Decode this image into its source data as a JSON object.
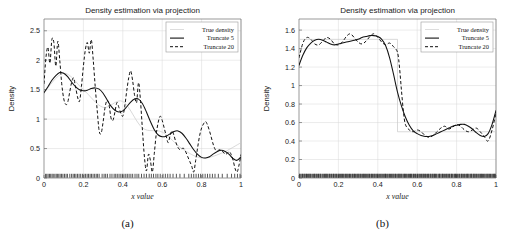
{
  "figure": {
    "panels": [
      {
        "caption": "(a)",
        "title": "Density estimation via projection",
        "xlabel": "x value",
        "ylabel": "Density"
      },
      {
        "caption": "(b)",
        "title": "Density estimation via projection",
        "xlabel": "x value",
        "ylabel": "Density"
      }
    ]
  },
  "legend": {
    "items": [
      {
        "label": "True density",
        "style": "true"
      },
      {
        "label": "Truncate 5",
        "style": "solid"
      },
      {
        "label": "Truncate 20",
        "style": "dashed"
      }
    ]
  },
  "chart_data": [
    {
      "type": "line",
      "title": "Density estimation via projection",
      "xlabel": "x value",
      "ylabel": "Density",
      "caption": "(a)",
      "xlim": [
        0,
        1
      ],
      "ylim": [
        0,
        2.7
      ],
      "xticks": [
        0,
        0.2,
        0.4,
        0.6,
        0.8,
        1
      ],
      "xticklabels": [
        "0",
        "0.2",
        "0.4",
        "0.6",
        "0.8",
        "1"
      ],
      "yticks": [
        0,
        0.5,
        1,
        1.5,
        2,
        2.5
      ],
      "yticklabels": [
        "0",
        "0.5",
        "1",
        "1.5",
        "2",
        "2.5"
      ],
      "grid": true,
      "legend_position": "upper-right",
      "series": [
        {
          "name": "True density",
          "style": "true",
          "x": [
            0,
            0.1,
            0.2,
            0.3,
            0.4,
            0.5,
            0.6,
            0.7,
            0.8,
            0.9,
            1
          ],
          "y": [
            1.45,
            1.78,
            1.5,
            1.2,
            1.3,
            0.85,
            0.78,
            0.5,
            0.34,
            0.42,
            0.6
          ]
        },
        {
          "name": "Truncate 5",
          "style": "solid",
          "x": [
            0.0,
            0.02,
            0.04,
            0.06,
            0.08,
            0.1,
            0.12,
            0.14,
            0.16,
            0.18,
            0.2,
            0.22,
            0.24,
            0.26,
            0.28,
            0.3,
            0.32,
            0.34,
            0.36,
            0.38,
            0.4,
            0.42,
            0.44,
            0.46,
            0.48,
            0.5,
            0.52,
            0.54,
            0.56,
            0.58,
            0.6,
            0.62,
            0.64,
            0.66,
            0.68,
            0.7,
            0.72,
            0.74,
            0.76,
            0.78,
            0.8,
            0.82,
            0.84,
            0.86,
            0.88,
            0.9,
            0.92,
            0.94,
            0.96,
            0.98,
            1.0
          ],
          "y": [
            1.45,
            1.55,
            1.66,
            1.74,
            1.79,
            1.78,
            1.72,
            1.63,
            1.55,
            1.5,
            1.48,
            1.49,
            1.52,
            1.53,
            1.51,
            1.44,
            1.33,
            1.22,
            1.15,
            1.12,
            1.14,
            1.21,
            1.29,
            1.34,
            1.34,
            1.26,
            1.12,
            0.96,
            0.82,
            0.73,
            0.7,
            0.71,
            0.75,
            0.79,
            0.8,
            0.76,
            0.68,
            0.58,
            0.48,
            0.4,
            0.35,
            0.34,
            0.36,
            0.41,
            0.45,
            0.47,
            0.45,
            0.4,
            0.33,
            0.3,
            0.36
          ]
        },
        {
          "name": "Truncate 20",
          "style": "dashed",
          "x": [
            0.0,
            0.01,
            0.02,
            0.03,
            0.04,
            0.05,
            0.06,
            0.07,
            0.08,
            0.09,
            0.1,
            0.11,
            0.12,
            0.13,
            0.14,
            0.15,
            0.16,
            0.17,
            0.18,
            0.19,
            0.2,
            0.21,
            0.22,
            0.23,
            0.24,
            0.25,
            0.26,
            0.27,
            0.28,
            0.29,
            0.3,
            0.31,
            0.32,
            0.33,
            0.34,
            0.35,
            0.36,
            0.37,
            0.38,
            0.39,
            0.4,
            0.41,
            0.42,
            0.43,
            0.44,
            0.45,
            0.46,
            0.47,
            0.48,
            0.49,
            0.5,
            0.51,
            0.52,
            0.53,
            0.54,
            0.55,
            0.56,
            0.57,
            0.58,
            0.59,
            0.6,
            0.61,
            0.62,
            0.63,
            0.64,
            0.65,
            0.66,
            0.67,
            0.68,
            0.69,
            0.7,
            0.71,
            0.72,
            0.73,
            0.74,
            0.75,
            0.76,
            0.77,
            0.78,
            0.79,
            0.8,
            0.81,
            0.82,
            0.83,
            0.84,
            0.85,
            0.86,
            0.87,
            0.88,
            0.89,
            0.9,
            0.91,
            0.92,
            0.93,
            0.94,
            0.95,
            0.96,
            0.97,
            0.98,
            0.99,
            1.0
          ],
          "y": [
            1.6,
            2.05,
            2.22,
            1.95,
            2.35,
            2.3,
            1.9,
            2.32,
            2.0,
            1.6,
            1.35,
            1.25,
            1.28,
            1.45,
            1.62,
            1.7,
            1.55,
            1.38,
            1.3,
            1.55,
            1.9,
            2.18,
            2.3,
            2.12,
            2.35,
            2.0,
            1.55,
            1.15,
            0.8,
            0.76,
            0.95,
            1.2,
            1.32,
            1.25,
            1.02,
            0.98,
            1.12,
            1.28,
            1.2,
            1.1,
            1.05,
            1.22,
            1.48,
            1.7,
            1.82,
            1.65,
            1.4,
            1.28,
            1.62,
            1.3,
            0.8,
            0.35,
            0.12,
            0.4,
            0.3,
            0.1,
            0.42,
            0.75,
            0.95,
            1.05,
            0.98,
            0.85,
            0.72,
            0.6,
            0.72,
            0.8,
            0.72,
            0.6,
            0.52,
            0.48,
            0.5,
            0.5,
            0.44,
            0.36,
            0.28,
            0.2,
            0.1,
            0.3,
            0.52,
            0.72,
            0.85,
            0.92,
            0.96,
            0.9,
            0.8,
            0.68,
            0.56,
            0.48,
            0.46,
            0.48,
            0.47,
            0.44,
            0.4,
            0.42,
            0.45,
            0.4,
            0.3,
            0.16,
            0.1,
            0.22,
            0.4
          ]
        }
      ],
      "rug": {
        "label": "data-rug",
        "density": "sparse",
        "x": [
          0.008,
          0.014,
          0.021,
          0.028,
          0.034,
          0.041,
          0.047,
          0.055,
          0.062,
          0.068,
          0.075,
          0.082,
          0.089,
          0.096,
          0.104,
          0.112,
          0.119,
          0.131,
          0.14,
          0.148,
          0.155,
          0.162,
          0.17,
          0.178,
          0.186,
          0.195,
          0.203,
          0.211,
          0.219,
          0.226,
          0.234,
          0.241,
          0.249,
          0.257,
          0.265,
          0.272,
          0.28,
          0.295,
          0.305,
          0.313,
          0.322,
          0.335,
          0.345,
          0.356,
          0.364,
          0.372,
          0.381,
          0.39,
          0.398,
          0.406,
          0.415,
          0.423,
          0.432,
          0.441,
          0.45,
          0.462,
          0.472,
          0.481,
          0.495,
          0.508,
          0.52,
          0.534,
          0.545,
          0.556,
          0.568,
          0.578,
          0.59,
          0.604,
          0.616,
          0.628,
          0.64,
          0.655,
          0.672,
          0.69,
          0.712,
          0.735,
          0.748,
          0.76,
          0.772,
          0.784,
          0.795,
          0.806,
          0.818,
          0.83,
          0.842,
          0.855,
          0.868,
          0.885,
          0.905,
          0.93,
          0.952,
          0.968,
          0.982,
          0.995
        ]
      }
    },
    {
      "type": "line",
      "title": "Density estimation via projection",
      "xlabel": "x value",
      "ylabel": "Density",
      "caption": "(b)",
      "xlim": [
        0,
        1
      ],
      "ylim": [
        0,
        1.72
      ],
      "xticks": [
        0,
        0.2,
        0.4,
        0.6,
        0.8,
        1
      ],
      "xticklabels": [
        "0",
        "0.2",
        "0.4",
        "0.6",
        "0.8",
        "1"
      ],
      "yticks": [
        0,
        0.2,
        0.4,
        0.6,
        0.8,
        1,
        1.2,
        1.4,
        1.6
      ],
      "yticklabels": [
        "0",
        "0.2",
        "0.4",
        "0.6",
        "0.8",
        "1",
        "1.2",
        "1.4",
        "1.6"
      ],
      "grid": true,
      "legend_position": "upper-right",
      "series": [
        {
          "name": "True density",
          "style": "true",
          "x": [
            0,
            0.25,
            0.5,
            0.5,
            0.75,
            1
          ],
          "y": [
            1.5,
            1.5,
            1.5,
            0.5,
            0.5,
            0.5
          ]
        },
        {
          "name": "Truncate 5",
          "style": "solid",
          "x": [
            0.0,
            0.02,
            0.04,
            0.06,
            0.08,
            0.1,
            0.12,
            0.14,
            0.16,
            0.18,
            0.2,
            0.22,
            0.24,
            0.26,
            0.28,
            0.3,
            0.32,
            0.34,
            0.36,
            0.38,
            0.4,
            0.42,
            0.44,
            0.46,
            0.48,
            0.5,
            0.52,
            0.54,
            0.56,
            0.58,
            0.6,
            0.62,
            0.64,
            0.66,
            0.68,
            0.7,
            0.72,
            0.74,
            0.76,
            0.78,
            0.8,
            0.82,
            0.84,
            0.86,
            0.88,
            0.9,
            0.92,
            0.94,
            0.96,
            0.98,
            1.0
          ],
          "y": [
            1.22,
            1.33,
            1.41,
            1.46,
            1.49,
            1.5,
            1.49,
            1.47,
            1.45,
            1.44,
            1.45,
            1.46,
            1.47,
            1.48,
            1.49,
            1.5,
            1.52,
            1.53,
            1.54,
            1.54,
            1.53,
            1.5,
            1.43,
            1.3,
            1.12,
            0.93,
            0.78,
            0.66,
            0.57,
            0.51,
            0.48,
            0.46,
            0.45,
            0.45,
            0.46,
            0.48,
            0.5,
            0.52,
            0.54,
            0.56,
            0.57,
            0.58,
            0.58,
            0.56,
            0.53,
            0.49,
            0.46,
            0.45,
            0.48,
            0.58,
            0.73
          ]
        },
        {
          "name": "Truncate 20",
          "style": "dashed",
          "x": [
            0.0,
            0.02,
            0.04,
            0.06,
            0.08,
            0.1,
            0.12,
            0.14,
            0.16,
            0.18,
            0.2,
            0.22,
            0.24,
            0.26,
            0.28,
            0.3,
            0.32,
            0.34,
            0.36,
            0.38,
            0.4,
            0.42,
            0.44,
            0.46,
            0.48,
            0.5,
            0.51,
            0.52,
            0.53,
            0.54,
            0.56,
            0.58,
            0.6,
            0.62,
            0.64,
            0.66,
            0.68,
            0.7,
            0.72,
            0.74,
            0.76,
            0.78,
            0.8,
            0.82,
            0.84,
            0.86,
            0.88,
            0.9,
            0.92,
            0.94,
            0.96,
            0.98,
            1.0
          ],
          "y": [
            1.3,
            1.46,
            1.52,
            1.5,
            1.45,
            1.44,
            1.48,
            1.52,
            1.5,
            1.45,
            1.44,
            1.47,
            1.53,
            1.56,
            1.52,
            1.47,
            1.45,
            1.48,
            1.53,
            1.56,
            1.52,
            1.47,
            1.44,
            1.46,
            1.42,
            1.36,
            1.2,
            0.95,
            0.72,
            0.58,
            0.52,
            0.5,
            0.52,
            0.5,
            0.46,
            0.44,
            0.46,
            0.5,
            0.54,
            0.56,
            0.53,
            0.55,
            0.58,
            0.56,
            0.52,
            0.5,
            0.52,
            0.54,
            0.5,
            0.45,
            0.4,
            0.52,
            0.7
          ]
        }
      ],
      "rug": {
        "label": "data-rug",
        "density": "dense",
        "count": 260
      }
    }
  ]
}
